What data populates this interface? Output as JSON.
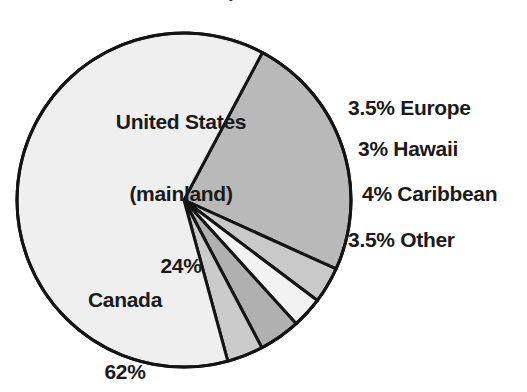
{
  "figure": {
    "background_color": "#ffffff",
    "width": 527,
    "height": 392,
    "title_fragment": "."
  },
  "chart_data": {
    "type": "pie",
    "title": "",
    "xlabel": "",
    "ylabel": "",
    "legend_position": "none",
    "grid": false,
    "total": 100,
    "unit": "%",
    "start_angle_deg": -62,
    "direction": "clockwise",
    "center": {
      "x": 184,
      "y": 200
    },
    "radius": 167,
    "stroke_color": "#141414",
    "stroke_width": 3,
    "categories": [
      "United States (mainland)",
      "Europe",
      "Hawaii",
      "Caribbean",
      "Other",
      "Canada"
    ],
    "values": [
      24,
      3.5,
      3,
      4,
      3.5,
      62
    ],
    "colors": [
      "#b9b9b9",
      "#c9c9c9",
      "#f2f2f2",
      "#b0b0b0",
      "#cbcbcb",
      "#efefef"
    ],
    "slices": [
      {
        "name": "United States (mainland)",
        "value": 24,
        "value_text": "24%",
        "label_lines": [
          "United States",
          "(mainland)",
          "24%"
        ],
        "label_placement": "inside",
        "color": "#b9b9b9"
      },
      {
        "name": "Europe",
        "value": 3.5,
        "value_text": "3.5%",
        "label_lines": [
          "3.5% Europe"
        ],
        "label_placement": "outside-right",
        "color": "#c9c9c9"
      },
      {
        "name": "Hawaii",
        "value": 3,
        "value_text": "3%",
        "label_lines": [
          "3% Hawaii"
        ],
        "label_placement": "outside-right",
        "color": "#f2f2f2"
      },
      {
        "name": "Caribbean",
        "value": 4,
        "value_text": "4%",
        "label_lines": [
          "4% Caribbean"
        ],
        "label_placement": "outside-right",
        "color": "#b0b0b0"
      },
      {
        "name": "Other",
        "value": 3.5,
        "value_text": "3.5%",
        "label_lines": [
          "3.5% Other"
        ],
        "label_placement": "outside-right",
        "color": "#cbcbcb"
      },
      {
        "name": "Canada",
        "value": 62,
        "value_text": "62%",
        "label_lines": [
          "Canada",
          "62%"
        ],
        "label_placement": "inside",
        "color": "#efefef"
      }
    ]
  },
  "labels": {
    "united_states": {
      "line1": "United States",
      "line2": "(mainland)",
      "line3": "24%"
    },
    "canada": {
      "line1": "Canada",
      "line2": "62%"
    },
    "europe": "3.5% Europe",
    "hawaii": "3% Hawaii",
    "caribbean": "4% Caribbean",
    "other": "3.5% Other"
  }
}
